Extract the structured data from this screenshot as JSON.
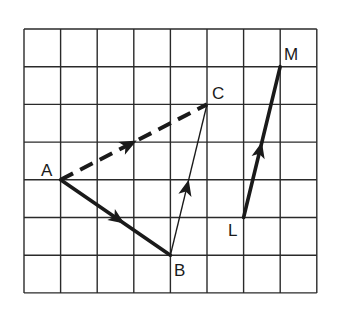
{
  "diagram": {
    "type": "vector-grid",
    "grid": {
      "columns": 8,
      "rows": 7,
      "x_lines": [
        24,
        60.6,
        97.2,
        133.8,
        170.4,
        207,
        243.6,
        280.2,
        316.8
      ],
      "y_lines": [
        29,
        66.7,
        104.4,
        142.1,
        179.8,
        217.5,
        255.2,
        292.9
      ],
      "color": "#2a2a2a"
    },
    "points": {
      "A": {
        "label": "A",
        "col": 1,
        "row": 4
      },
      "B": {
        "label": "B",
        "col": 4,
        "row": 6
      },
      "C": {
        "label": "C",
        "col": 5,
        "row": 2
      },
      "L": {
        "label": "L",
        "col": 6,
        "row": 5
      },
      "M": {
        "label": "M",
        "col": 7,
        "row": 1
      }
    },
    "vectors": [
      {
        "name": "AB",
        "from": "A",
        "to": "B",
        "style": "solid-thick"
      },
      {
        "name": "BC",
        "from": "B",
        "to": "C",
        "style": "solid-thin"
      },
      {
        "name": "AC",
        "from": "A",
        "to": "C",
        "style": "dashed-thick"
      },
      {
        "name": "LM",
        "from": "L",
        "to": "M",
        "style": "solid-thick"
      }
    ],
    "labels": {
      "A": "A",
      "B": "B",
      "C": "C",
      "L": "L",
      "M": "M"
    },
    "ink_color": "#1a1a1a"
  }
}
